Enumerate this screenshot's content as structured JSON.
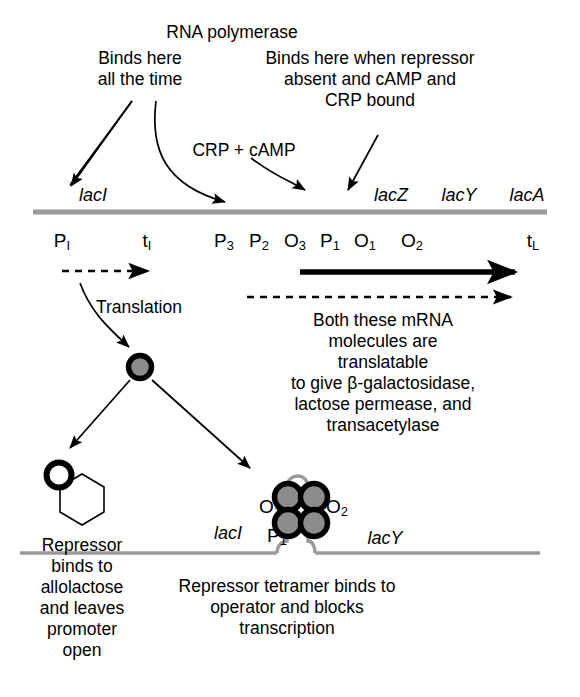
{
  "figure": {
    "colors": {
      "ink": "#000000",
      "dna_line": "#9a9a9a",
      "protein_fill": "#8c8c8c",
      "background": "#ffffff"
    }
  },
  "annotations": {
    "rna_polymerase_label": "RNA polymerase",
    "left_note": "Binds here\nall the time",
    "left_note_lines": [
      "Binds here",
      "all the time"
    ],
    "right_note_lines": [
      "Binds here when repressor",
      "absent and cAMP and",
      "CRP bound"
    ],
    "crp_camp_label": "CRP + cAMP",
    "translation_label": "Translation",
    "mrna_note_lines": [
      "Both these mRNA",
      "molecules are translatable",
      "to give β-galactosidase,",
      "lactose permease, and",
      "transacetylase"
    ],
    "allolactose_note_lines": [
      "Repressor",
      "binds to",
      "allolactose",
      "and leaves",
      "promoter",
      "open"
    ],
    "tetramer_note_lines": [
      "Repressor tetramer binds to",
      "operator and blocks",
      "transcription"
    ]
  },
  "gene_map": {
    "genes_left": [
      "lacI"
    ],
    "genes_right": [
      "lacZ",
      "lacY",
      "lacA"
    ],
    "sites": [
      {
        "base": "P",
        "sub": "I"
      },
      {
        "base": "t",
        "sub": "I"
      },
      {
        "base": "P",
        "sub": "3"
      },
      {
        "base": "P",
        "sub": "2"
      },
      {
        "base": "O",
        "sub": "3"
      },
      {
        "base": "P",
        "sub": "1"
      },
      {
        "base": "O",
        "sub": "1"
      },
      {
        "base": "O",
        "sub": "2"
      },
      {
        "base": "t",
        "sub": "L"
      }
    ]
  },
  "bottom_panel": {
    "gene_left": "lacI",
    "gene_right": "lacY",
    "operator_left": {
      "base": "O",
      "sub": "1"
    },
    "operator_right": {
      "base": "O",
      "sub": "2"
    },
    "promoter": {
      "base": "P",
      "sub": "1"
    }
  }
}
